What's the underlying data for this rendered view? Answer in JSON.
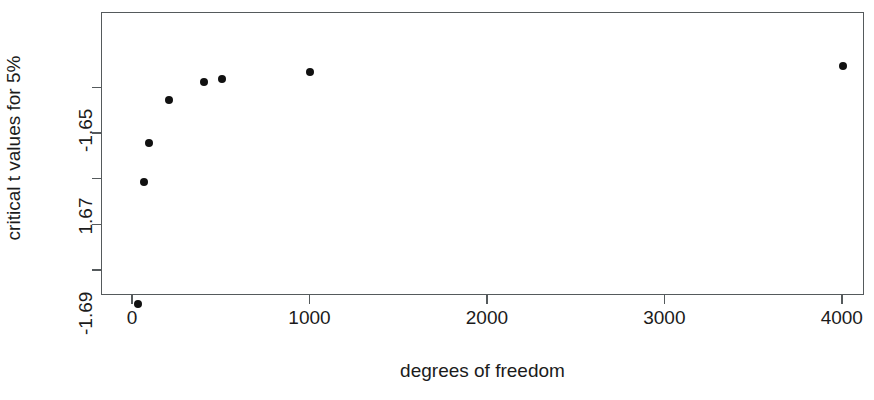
{
  "chart_data": {
    "type": "scatter",
    "title": "",
    "xlabel": "degrees of freedom",
    "ylabel": "critical t values for 5%",
    "xlim": [
      -175,
      4125
    ],
    "ylim": [
      -1.6955,
      -1.6335
    ],
    "grid": false,
    "legend": null,
    "x": [
      30,
      60,
      90,
      200,
      400,
      500,
      1000,
      4000
    ],
    "y": [
      -1.6973,
      -1.6706,
      -1.662,
      -1.6525,
      -1.6487,
      -1.6479,
      -1.6464,
      -1.6452
    ],
    "points": [
      {
        "x": 30,
        "y": -1.6973
      },
      {
        "x": 60,
        "y": -1.6706
      },
      {
        "x": 90,
        "y": -1.662
      },
      {
        "x": 200,
        "y": -1.6525
      },
      {
        "x": 400,
        "y": -1.6487
      },
      {
        "x": 500,
        "y": -1.6479
      },
      {
        "x": 1000,
        "y": -1.6464
      },
      {
        "x": 4000,
        "y": -1.6452
      }
    ],
    "xticks": [
      {
        "value": 0,
        "label": "0"
      },
      {
        "value": 1000,
        "label": "1000"
      },
      {
        "value": 2000,
        "label": "2000"
      },
      {
        "value": 3000,
        "label": "3000"
      },
      {
        "value": 4000,
        "label": "4000"
      }
    ],
    "yticks": [
      {
        "value": -1.65,
        "label": "-1.65"
      },
      {
        "value": -1.66,
        "label": ""
      },
      {
        "value": -1.67,
        "label": "1.67"
      },
      {
        "value": -1.68,
        "label": ""
      },
      {
        "value": -1.69,
        "label": "-1.69"
      }
    ],
    "point_color": "#111111",
    "axis_color": "#555a5c",
    "background_color": "#ffffff"
  }
}
